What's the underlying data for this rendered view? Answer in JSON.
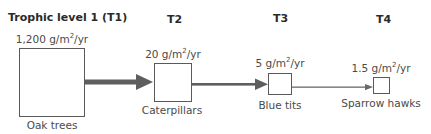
{
  "levels": [
    {
      "header": "Trophic level 1 (T1)",
      "value_num": "1,200 g/m",
      "value_exp": "2",
      "value_unit": "/yr",
      "organism": "Oak trees"
    },
    {
      "header": "T2",
      "value_num": "20 g/m",
      "value_exp": "2",
      "value_unit": "/yr",
      "organism": "Caterpillars"
    },
    {
      "header": "T3",
      "value_num": "5 g/m",
      "value_exp": "2",
      "value_unit": "/yr",
      "organism": "Blue tits"
    },
    {
      "header": "T4",
      "value_num": "1.5 g/m",
      "value_exp": "2",
      "value_unit": "/yr",
      "organism": "Sparrow hawks"
    }
  ],
  "colors": {
    "arrow": "#5e5e5e",
    "box_border": "#5a5a5a",
    "text": "#4a4a4a"
  }
}
